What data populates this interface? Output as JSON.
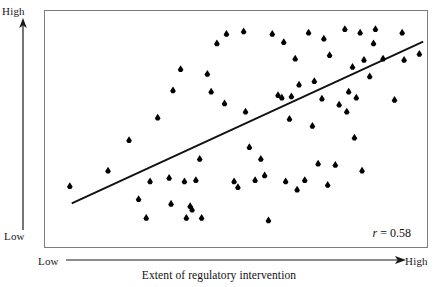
{
  "figure": {
    "title": "",
    "caption": "Extent of regulatory intervention",
    "y_axis": {
      "high_label": "High",
      "low_label": "Low"
    },
    "x_axis": {
      "low_label": "Low",
      "high_label": "High"
    },
    "annotation": {
      "symbol": "r",
      "text": " = 0.58",
      "full": "r = 0.58"
    },
    "colors": {
      "marker": "#000000",
      "trendline": "#111111",
      "frame": "#7d7d7d",
      "background": "#ffffff",
      "text": "#1a1a1a"
    }
  },
  "chart_data": {
    "type": "scatter",
    "title": "",
    "xlabel": "Extent of regulatory intervention",
    "ylabel": "",
    "xlim": [
      0,
      100
    ],
    "ylim": [
      0,
      100
    ],
    "xtick_labels": [
      "Low",
      "High"
    ],
    "ytick_labels": [
      "Low",
      "High"
    ],
    "grid": false,
    "legend": null,
    "annotations": [
      {
        "text": "r = 0.58",
        "x": 88,
        "y": 6
      }
    ],
    "correlation_r": 0.58,
    "marker_style": "filled-diamond",
    "n_points": 70,
    "points": [
      {
        "x": 6.5,
        "y": 26.0
      },
      {
        "x": 16.5,
        "y": 32.5
      },
      {
        "x": 22.0,
        "y": 45.5
      },
      {
        "x": 24.5,
        "y": 20.5
      },
      {
        "x": 26.5,
        "y": 12.5
      },
      {
        "x": 27.5,
        "y": 28.0
      },
      {
        "x": 29.5,
        "y": 55.0
      },
      {
        "x": 32.5,
        "y": 29.5
      },
      {
        "x": 33.0,
        "y": 18.5
      },
      {
        "x": 33.5,
        "y": 66.5
      },
      {
        "x": 35.5,
        "y": 75.5
      },
      {
        "x": 36.5,
        "y": 28.0
      },
      {
        "x": 37.0,
        "y": 12.5
      },
      {
        "x": 38.0,
        "y": 17.5
      },
      {
        "x": 38.5,
        "y": 16.0
      },
      {
        "x": 39.5,
        "y": 28.5
      },
      {
        "x": 40.5,
        "y": 37.5
      },
      {
        "x": 41.0,
        "y": 12.5
      },
      {
        "x": 42.5,
        "y": 73.5
      },
      {
        "x": 43.5,
        "y": 66.0
      },
      {
        "x": 45.0,
        "y": 86.5
      },
      {
        "x": 47.0,
        "y": 61.0
      },
      {
        "x": 47.5,
        "y": 90.5
      },
      {
        "x": 49.5,
        "y": 28.0
      },
      {
        "x": 50.5,
        "y": 25.5
      },
      {
        "x": 52.0,
        "y": 91.5
      },
      {
        "x": 52.5,
        "y": 57.5
      },
      {
        "x": 53.5,
        "y": 42.5
      },
      {
        "x": 55.0,
        "y": 28.5
      },
      {
        "x": 56.5,
        "y": 37.5
      },
      {
        "x": 57.5,
        "y": 30.5
      },
      {
        "x": 58.5,
        "y": 11.5
      },
      {
        "x": 59.5,
        "y": 90.5
      },
      {
        "x": 61.0,
        "y": 64.5
      },
      {
        "x": 62.0,
        "y": 63.5
      },
      {
        "x": 62.5,
        "y": 87.0
      },
      {
        "x": 63.0,
        "y": 28.0
      },
      {
        "x": 64.0,
        "y": 54.5
      },
      {
        "x": 64.5,
        "y": 64.0
      },
      {
        "x": 65.5,
        "y": 80.0
      },
      {
        "x": 66.0,
        "y": 24.5
      },
      {
        "x": 66.5,
        "y": 69.0
      },
      {
        "x": 68.0,
        "y": 28.5
      },
      {
        "x": 69.0,
        "y": 91.0
      },
      {
        "x": 70.0,
        "y": 51.5
      },
      {
        "x": 70.5,
        "y": 70.5
      },
      {
        "x": 71.5,
        "y": 35.5
      },
      {
        "x": 72.5,
        "y": 63.0
      },
      {
        "x": 73.0,
        "y": 88.5
      },
      {
        "x": 74.0,
        "y": 26.5
      },
      {
        "x": 74.5,
        "y": 81.5
      },
      {
        "x": 76.0,
        "y": 35.0
      },
      {
        "x": 77.0,
        "y": 60.5
      },
      {
        "x": 78.5,
        "y": 92.5
      },
      {
        "x": 79.0,
        "y": 57.5
      },
      {
        "x": 79.5,
        "y": 66.0
      },
      {
        "x": 80.5,
        "y": 76.5
      },
      {
        "x": 81.0,
        "y": 46.5
      },
      {
        "x": 81.5,
        "y": 63.5
      },
      {
        "x": 82.5,
        "y": 91.0
      },
      {
        "x": 83.0,
        "y": 32.5
      },
      {
        "x": 83.5,
        "y": 79.5
      },
      {
        "x": 85.0,
        "y": 72.5
      },
      {
        "x": 86.0,
        "y": 86.5
      },
      {
        "x": 86.5,
        "y": 92.5
      },
      {
        "x": 88.5,
        "y": 80.0
      },
      {
        "x": 91.5,
        "y": 62.5
      },
      {
        "x": 93.5,
        "y": 91.0
      },
      {
        "x": 94.0,
        "y": 79.5
      },
      {
        "x": 98.0,
        "y": 82.0
      }
    ],
    "trendline": {
      "type": "linear-fit",
      "x0": 7.0,
      "y0": 18.5,
      "x1": 99.0,
      "y1": 87.0
    }
  }
}
